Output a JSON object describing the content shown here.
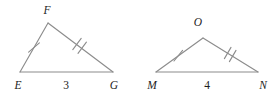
{
  "figure": {
    "type": "geometry-diagram",
    "stroke_color": "#8c8c8c",
    "label_color": "#1d1d1d",
    "background_color": "#ffffff",
    "triangles": [
      {
        "name": "triangle-EFG",
        "vertices": [
          {
            "name": "E",
            "label": "E",
            "x": 20,
            "y": 72,
            "label_x": 18,
            "label_y": 89
          },
          {
            "name": "F",
            "label": "F",
            "x": 48,
            "y": 23,
            "label_x": 47,
            "label_y": 14
          },
          {
            "name": "G",
            "label": "G",
            "x": 113,
            "y": 72,
            "label_x": 114,
            "label_y": 89
          }
        ],
        "sides": [
          {
            "name": "side-EF",
            "from": "E",
            "to": "F",
            "ticks": 1
          },
          {
            "name": "side-FG",
            "from": "F",
            "to": "G",
            "ticks": 2
          },
          {
            "name": "side-EG",
            "from": "E",
            "to": "G",
            "ticks": 0,
            "length_label": "3"
          }
        ],
        "base_length_label": "3",
        "base_label_x": 66,
        "base_label_y": 89
      },
      {
        "name": "triangle-MON",
        "vertices": [
          {
            "name": "M",
            "label": "M",
            "x": 156,
            "y": 72,
            "label_x": 154,
            "label_y": 89
          },
          {
            "name": "O",
            "label": "O",
            "x": 203,
            "y": 38,
            "label_x": 198,
            "label_y": 26
          },
          {
            "name": "N",
            "label": "N",
            "x": 258,
            "y": 72,
            "label_x": 262,
            "label_y": 89
          }
        ],
        "sides": [
          {
            "name": "side-MO",
            "from": "M",
            "to": "O",
            "ticks": 1
          },
          {
            "name": "side-ON",
            "from": "O",
            "to": "N",
            "ticks": 2
          },
          {
            "name": "side-MN",
            "from": "M",
            "to": "N",
            "ticks": 0,
            "length_label": "4"
          }
        ],
        "base_length_label": "4",
        "base_label_x": 207,
        "base_label_y": 89
      }
    ]
  }
}
